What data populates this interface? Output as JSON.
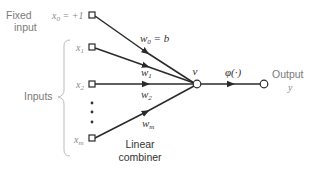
{
  "diagram": {
    "type": "perceptron-neuron-model",
    "fixed_input": {
      "label_line1": "Fixed",
      "label_line2": "input",
      "symbol": "x",
      "subscript": "0",
      "value_text": " = +1"
    },
    "inputs_label": "Inputs",
    "inputs": [
      {
        "symbol": "x",
        "subscript": "1"
      },
      {
        "symbol": "x",
        "subscript": "2"
      },
      {
        "symbol": "x",
        "subscript": "m"
      }
    ],
    "weights": [
      {
        "symbol": "w",
        "subscript": "0",
        "suffix": " = b"
      },
      {
        "symbol": "w",
        "subscript": "1",
        "suffix": ""
      },
      {
        "symbol": "w",
        "subscript": "2",
        "suffix": ""
      },
      {
        "symbol": "w",
        "subscript": "m",
        "suffix": ""
      }
    ],
    "summing_node_label": "v",
    "activation_label": "φ(·)",
    "output_label": "Output",
    "output_symbol": "y",
    "combiner_label_line1": "Linear",
    "combiner_label_line2": "combiner",
    "colors": {
      "line": "#2a2a2a",
      "label_gray": "#7a7a7a",
      "math_dark": "#333333"
    }
  }
}
